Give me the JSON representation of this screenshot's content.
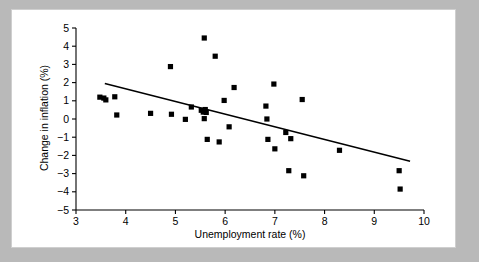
{
  "figure": {
    "background_color": "#b9b9b9",
    "plot_background_color": "#ffffff",
    "marker_color": "#000000",
    "line_color": "#000000"
  },
  "chart_data": {
    "type": "scatter",
    "title": "",
    "xlabel": "Unemployment rate (%)",
    "ylabel": "Change in inflation (%)",
    "xlim": [
      3,
      10
    ],
    "ylim": [
      -5,
      5
    ],
    "xticks": [
      3,
      4,
      5,
      6,
      7,
      8,
      9,
      10
    ],
    "xtick_labels": [
      "3",
      "4",
      "5",
      "6",
      "7",
      "8",
      "9",
      "10"
    ],
    "yticks": [
      -5,
      -4,
      -3,
      -2,
      -1,
      0,
      1,
      2,
      3,
      4,
      5
    ],
    "ytick_labels": [
      "−5",
      "−4",
      "−3",
      "−2",
      "−1",
      "0",
      "1",
      "2",
      "3",
      "4",
      "5"
    ],
    "grid": false,
    "legend": null,
    "marker": "square",
    "series": [
      {
        "name": "Unemployment vs change in inflation",
        "points": [
          [
            3.48,
            1.2
          ],
          [
            3.56,
            1.15
          ],
          [
            3.6,
            1.05
          ],
          [
            3.78,
            1.22
          ],
          [
            3.82,
            0.22
          ],
          [
            4.5,
            0.31
          ],
          [
            4.9,
            2.88
          ],
          [
            4.92,
            0.26
          ],
          [
            5.2,
            -0.02
          ],
          [
            5.32,
            0.66
          ],
          [
            5.52,
            0.48
          ],
          [
            5.56,
            0.38
          ],
          [
            5.58,
            4.45
          ],
          [
            5.58,
            0.02
          ],
          [
            5.6,
            0.52
          ],
          [
            5.62,
            0.36
          ],
          [
            5.64,
            -1.12
          ],
          [
            5.8,
            3.45
          ],
          [
            5.88,
            -1.26
          ],
          [
            5.98,
            1.02
          ],
          [
            6.08,
            -0.43
          ],
          [
            6.18,
            1.73
          ],
          [
            6.82,
            0.71
          ],
          [
            6.84,
            0.0
          ],
          [
            6.86,
            -1.12
          ],
          [
            6.98,
            1.92
          ],
          [
            7.0,
            -1.64
          ],
          [
            7.22,
            -0.74
          ],
          [
            7.28,
            -2.84
          ],
          [
            7.32,
            -1.08
          ],
          [
            7.55,
            1.07
          ],
          [
            7.58,
            -3.12
          ],
          [
            8.3,
            -1.72
          ],
          [
            9.5,
            -2.84
          ],
          [
            9.52,
            -3.85
          ]
        ]
      }
    ],
    "trendline": {
      "name": "fitted regression line",
      "x_start": 3.58,
      "y_start": 1.95,
      "x_end": 9.72,
      "y_end": -2.32
    }
  }
}
